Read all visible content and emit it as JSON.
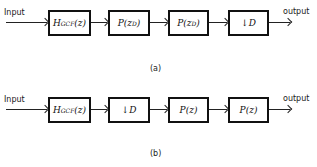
{
  "diagram_a": {
    "input_label": "Input",
    "output_label": "output",
    "caption": "(a)",
    "blocks": [
      {
        "main": "H",
        "sub": "GCF",
        "tail": "(z)"
      },
      {
        "main": "P(z",
        "sup": "D",
        "tail": ")"
      },
      {
        "main": "P(z",
        "sup": "D",
        "tail": ")"
      },
      {
        "arrow": "↓",
        "main": " D"
      }
    ]
  },
  "diagram_b": {
    "input_label": "Input",
    "output_label": "output",
    "caption": "(b)",
    "blocks": [
      {
        "main": "H",
        "sub": "GCF",
        "tail": "(z)"
      },
      {
        "arrow": "↓",
        "main": " D"
      },
      {
        "main": "P(z)"
      },
      {
        "main": "P(z)"
      }
    ]
  }
}
